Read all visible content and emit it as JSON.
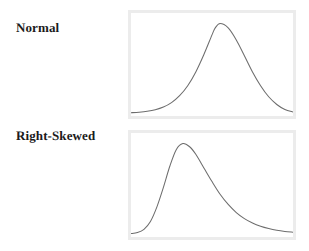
{
  "figure": {
    "background_color": "#ffffff"
  },
  "rows": [
    {
      "label": "Normal",
      "panel_name": "normal-distribution-panel"
    },
    {
      "label": "Right-Skewed",
      "panel_name": "right-skewed-distribution-panel"
    }
  ],
  "style": {
    "curve_color": "#6d6d6d",
    "panel_border_color": "#ececec",
    "panel_fill_color": "#ffffff",
    "label_color": "#1b1b1b"
  },
  "chart_data": [
    {
      "type": "line",
      "title": "Normal",
      "xlabel": "",
      "ylabel": "",
      "grid": false,
      "legend": "none",
      "xlim": [
        0,
        1
      ],
      "ylim": [
        0,
        1
      ],
      "annotations": [
        "symmetric bell-shaped curve",
        "peak near center of panel"
      ],
      "peak_x": 0.52,
      "peak_y": 0.93,
      "series": [
        {
          "name": "Normal density",
          "x": [
            0.0,
            0.05,
            0.1,
            0.15,
            0.2,
            0.25,
            0.3,
            0.35,
            0.4,
            0.45,
            0.5,
            0.52,
            0.55,
            0.6,
            0.65,
            0.7,
            0.75,
            0.8,
            0.85,
            0.9,
            0.95,
            1.0
          ],
          "values": [
            0.005,
            0.01,
            0.019,
            0.035,
            0.063,
            0.109,
            0.181,
            0.285,
            0.428,
            0.609,
            0.812,
            0.885,
            0.93,
            0.885,
            0.76,
            0.596,
            0.428,
            0.285,
            0.17,
            0.09,
            0.038,
            0.012
          ]
        }
      ]
    },
    {
      "type": "line",
      "title": "Right-Skewed",
      "xlabel": "",
      "ylabel": "",
      "grid": false,
      "legend": "none",
      "xlim": [
        0,
        1
      ],
      "ylim": [
        0,
        1
      ],
      "annotations": [
        "right-skewed curve",
        "peak left of center",
        "long tail extending to the right"
      ],
      "peak_x": 0.32,
      "peak_y": 0.93,
      "series": [
        {
          "name": "Right-skewed density",
          "x": [
            0.0,
            0.04,
            0.08,
            0.12,
            0.16,
            0.2,
            0.24,
            0.28,
            0.32,
            0.36,
            0.4,
            0.45,
            0.5,
            0.55,
            0.6,
            0.65,
            0.7,
            0.75,
            0.8,
            0.85,
            0.9,
            0.95,
            1.0
          ],
          "values": [
            0.006,
            0.016,
            0.05,
            0.13,
            0.28,
            0.48,
            0.7,
            0.87,
            0.93,
            0.9,
            0.82,
            0.68,
            0.54,
            0.41,
            0.305,
            0.222,
            0.16,
            0.115,
            0.082,
            0.058,
            0.04,
            0.028,
            0.02
          ]
        }
      ]
    }
  ]
}
